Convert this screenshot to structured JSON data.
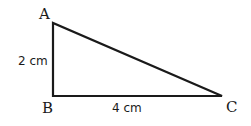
{
  "diagram": {
    "type": "right-triangle",
    "vertices": [
      {
        "label": "A",
        "x": 53,
        "y": 23
      },
      {
        "label": "B",
        "x": 53,
        "y": 96
      },
      {
        "label": "C",
        "x": 222,
        "y": 96
      }
    ],
    "sides": {
      "AB": "2 cm",
      "BC": "4 cm"
    },
    "stroke_color": "#1a1a1a"
  }
}
